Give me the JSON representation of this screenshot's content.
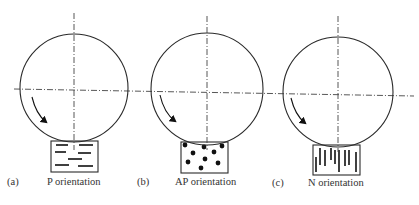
{
  "figure": {
    "panels": [
      {
        "id": "a",
        "letter": "(a)",
        "caption": "P orientation",
        "specimen_pattern": "horizontal-dashes",
        "circle": {
          "cx": 74,
          "cy": 88,
          "r": 54
        },
        "box": {
          "x": 51,
          "y": 141,
          "w": 47,
          "h": 31
        },
        "vertical_axis": {
          "x": 74,
          "y1": 13,
          "y2": 150
        },
        "arrow": {
          "path": "M 32 97 Q 36 114 46 122",
          "head": "46,122"
        },
        "letter_pos": {
          "x": 7,
          "y": 180
        },
        "caption_pos": {
          "x": 47,
          "y": 180
        },
        "dashes": [
          [
            56,
            145,
            68,
            145
          ],
          [
            79,
            145,
            93,
            145
          ],
          [
            55,
            152,
            66,
            152
          ],
          [
            78,
            153,
            91,
            153
          ],
          [
            68,
            159,
            82,
            159
          ],
          [
            55,
            165,
            69,
            165
          ],
          [
            78,
            166,
            93,
            166
          ]
        ]
      },
      {
        "id": "b",
        "letter": "(b)",
        "caption": "AP orientation",
        "specimen_pattern": "dots",
        "circle": {
          "cx": 207,
          "cy": 89,
          "r": 56
        },
        "box": {
          "x": 181,
          "y": 142,
          "w": 47,
          "h": 31
        },
        "vertical_axis": {
          "x": 207,
          "y1": 16,
          "y2": 150
        },
        "arrow": {
          "path": "M 160 95 Q 164 113 175 121",
          "head": "175,121"
        },
        "letter_pos": {
          "x": 137,
          "y": 180
        },
        "caption_pos": {
          "x": 175,
          "y": 180
        },
        "dots": [
          [
            185,
            145
          ],
          [
            204,
            147
          ],
          [
            222,
            146
          ],
          [
            193,
            153
          ],
          [
            214,
            152
          ],
          [
            188,
            162
          ],
          [
            205,
            159
          ],
          [
            218,
            163
          ],
          [
            201,
            168
          ]
        ]
      },
      {
        "id": "c",
        "letter": "(c)",
        "caption": "N orientation",
        "specimen_pattern": "vertical-lines",
        "circle": {
          "cx": 338,
          "cy": 92,
          "r": 55
        },
        "box": {
          "x": 313,
          "y": 145,
          "w": 47,
          "h": 30
        },
        "vertical_axis": {
          "x": 338,
          "y1": 16,
          "y2": 152
        },
        "arrow": {
          "path": "M 291 98 Q 295 115 305 123",
          "head": "305,123"
        },
        "letter_pos": {
          "x": 272,
          "y": 181
        },
        "caption_pos": {
          "x": 308,
          "y": 181
        },
        "lines": [
          [
            316,
            157,
            316,
            172
          ],
          [
            320,
            148,
            320,
            165
          ],
          [
            325,
            150,
            325,
            166
          ],
          [
            331,
            148,
            331,
            160
          ],
          [
            335,
            150,
            335,
            164
          ],
          [
            339,
            150,
            339,
            172
          ],
          [
            345,
            150,
            345,
            166
          ],
          [
            349,
            150,
            349,
            165
          ],
          [
            356,
            152,
            356,
            172
          ]
        ]
      }
    ],
    "horizontal_axis": {
      "x1": 14,
      "y1": 89,
      "x2": 414,
      "y2": 96
    },
    "colors": {
      "stroke": "#2a2a2a",
      "axis": "#444444",
      "fill": "#111111",
      "text": "#333333"
    }
  }
}
